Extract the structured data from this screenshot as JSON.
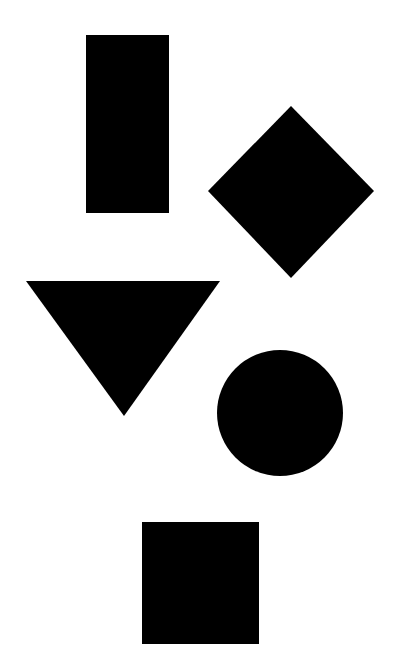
{
  "canvas": {
    "width": 398,
    "height": 667,
    "background": "#ffffff"
  },
  "shapes": [
    {
      "id": "rectangle",
      "type": "rect",
      "fill": "#000000",
      "x": 86,
      "y": 35,
      "width": 83,
      "height": 178
    },
    {
      "id": "diamond",
      "type": "polygon",
      "fill": "#000000",
      "points": "291,106 374,191 291,278 208,191"
    },
    {
      "id": "triangle",
      "type": "polygon",
      "fill": "#000000",
      "points": "26,281 220,281 124,416"
    },
    {
      "id": "circle",
      "type": "circle",
      "fill": "#000000",
      "cx": 280,
      "cy": 413,
      "r": 63
    },
    {
      "id": "square",
      "type": "rect",
      "fill": "#000000",
      "x": 142,
      "y": 522,
      "width": 117,
      "height": 122
    }
  ]
}
